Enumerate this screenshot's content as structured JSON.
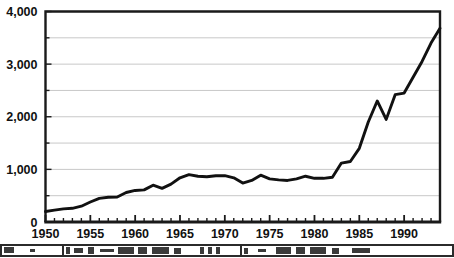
{
  "chart_data": {
    "type": "line",
    "title": "",
    "subtitle": "",
    "xlabel": "",
    "ylabel": "",
    "xlim": [
      1950,
      1994
    ],
    "ylim": [
      0,
      4000
    ],
    "grid": true,
    "legend": null,
    "y_ticks": [
      0,
      1000,
      2000,
      3000,
      4000
    ],
    "y_tick_labels": [
      "0",
      "1,000",
      "2,000",
      "3,000",
      "4,000"
    ],
    "y_minor_ticks": [
      500,
      1500,
      2500,
      3500
    ],
    "x_ticks": [
      1950,
      1955,
      1960,
      1965,
      1970,
      1975,
      1980,
      1985,
      1990
    ],
    "x_tick_labels": [
      "1950",
      "1955",
      "1960",
      "1965",
      "1970",
      "1975",
      "1980",
      "1985",
      "1990"
    ],
    "x_minor_tick_range": [
      1950,
      1994
    ],
    "x": [
      1950,
      1951,
      1952,
      1953,
      1954,
      1955,
      1956,
      1957,
      1958,
      1959,
      1960,
      1961,
      1962,
      1963,
      1964,
      1965,
      1966,
      1967,
      1968,
      1969,
      1970,
      1971,
      1972,
      1973,
      1974,
      1975,
      1976,
      1977,
      1978,
      1979,
      1980,
      1981,
      1982,
      1983,
      1984,
      1985,
      1986,
      1987,
      1988,
      1989,
      1990,
      1991,
      1992,
      1993,
      1994
    ],
    "values": [
      200,
      225,
      250,
      260,
      300,
      380,
      450,
      470,
      475,
      560,
      600,
      610,
      700,
      640,
      720,
      840,
      900,
      870,
      860,
      880,
      880,
      840,
      740,
      790,
      890,
      820,
      800,
      790,
      820,
      870,
      830,
      830,
      850,
      1120,
      1150,
      1400,
      1900,
      2300,
      1950,
      2420,
      2450,
      2750,
      3050,
      3400,
      3680
    ],
    "series_name": "",
    "colors": {
      "line": "#111111",
      "grid": "#c8c8c8",
      "frame": "#1a1a1a",
      "background": "#ffffff",
      "text": "#111111"
    }
  },
  "artifact": {
    "description": "scan-artifact-strip",
    "text": ""
  }
}
